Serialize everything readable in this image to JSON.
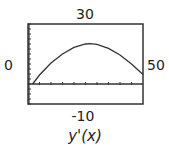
{
  "labels": {
    "ymax": "30",
    "ymin": "-10",
    "xmin": "0",
    "xmax": "50",
    "caption": "y'(x)"
  },
  "colors": {
    "frame": "#333333",
    "curve": "#333333",
    "axis": "#333333"
  },
  "chart_data": {
    "type": "line",
    "title": "",
    "caption": "y'(x)",
    "xlabel": "",
    "ylabel": "",
    "xlim": [
      0,
      50
    ],
    "ylim": [
      -10,
      30
    ],
    "x_tick_step": 5,
    "y_tick_step": 2.5,
    "grid": false,
    "legend": null,
    "series": [
      {
        "name": "y'(x)",
        "x": [
          2,
          5,
          10,
          15,
          20,
          25,
          27,
          30,
          35,
          40,
          45,
          50
        ],
        "values": [
          0,
          4.5,
          10.5,
          15,
          18.3,
          20,
          20.2,
          19.8,
          17.8,
          14.5,
          10,
          4.7
        ]
      }
    ]
  }
}
